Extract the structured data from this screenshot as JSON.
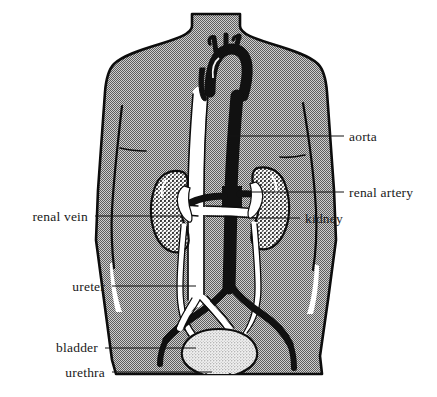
{
  "figure": {
    "width": 437,
    "height": 397,
    "background_color": "#ffffff"
  },
  "colors": {
    "body_fill": "#a9a9a9",
    "outline": "#0d0d0d",
    "artery_dark": "#111111",
    "vein_light": "#ffffff",
    "bladder_fill": "#dcdcdc",
    "kidney_speckle": "#2a2a2a",
    "label_text": "#1a1a1a",
    "leader_line": "#151515"
  },
  "labels": [
    {
      "id": "aorta",
      "text": "aorta",
      "side": "right",
      "text_x": 349,
      "text_y": 141,
      "leader_x1": 344,
      "leader_y1": 136,
      "leader_x2": 229,
      "leader_y2": 136
    },
    {
      "id": "renal-artery",
      "text": "renal artery",
      "side": "right",
      "text_x": 349,
      "text_y": 197,
      "leader_x1": 344,
      "leader_y1": 192,
      "leader_x2": 247,
      "leader_y2": 192
    },
    {
      "id": "kidney",
      "text": "kidney",
      "side": "right",
      "text_x": 305,
      "text_y": 223,
      "leader_x1": 300,
      "leader_y1": 218,
      "leader_x2": 259,
      "leader_y2": 218
    },
    {
      "id": "renal-vein",
      "text": "renal vein",
      "side": "left",
      "text_x": 25,
      "text_y": 221,
      "leader_x1": 95,
      "leader_y1": 216,
      "leader_x2": 182,
      "leader_y2": 216
    },
    {
      "id": "ureter",
      "text": "ureter",
      "side": "left",
      "text_x": 68,
      "text_y": 291,
      "leader_x1": 112,
      "leader_y1": 286,
      "leader_x2": 196,
      "leader_y2": 286
    },
    {
      "id": "bladder",
      "text": "bladder",
      "side": "left",
      "text_x": 38,
      "text_y": 346,
      "leader_x1": 105,
      "leader_y1": 348,
      "leader_x2": 196,
      "leader_y2": 348
    },
    {
      "id": "urethra",
      "text": "urethra",
      "side": "left",
      "text_x": 58,
      "text_y": 377,
      "leader_x1": 112,
      "leader_y1": 372,
      "leader_x2": 212,
      "leader_y2": 372
    }
  ],
  "anatomy": {
    "torso": "human-torso-outline",
    "organs": [
      "aortic-arch",
      "descending-aorta",
      "inferior-vena-cava",
      "left-kidney",
      "right-kidney",
      "left-renal-artery",
      "right-renal-artery",
      "left-renal-vein",
      "right-renal-vein",
      "left-ureter",
      "right-ureter",
      "iliac-arteries",
      "iliac-veins",
      "bladder",
      "urethra"
    ]
  }
}
